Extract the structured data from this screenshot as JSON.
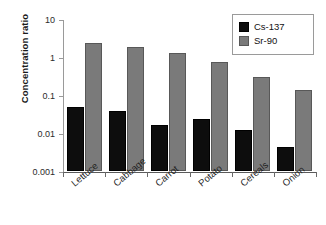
{
  "chart_data": {
    "type": "bar",
    "title": "",
    "xlabel": "",
    "ylabel": "Concentration ratio",
    "yscale": "log",
    "ylim": [
      0.001,
      10
    ],
    "ytick_labels": [
      "10",
      "1",
      "0.1",
      "0.01",
      "0.001"
    ],
    "ytick_values": [
      10,
      1,
      0.1,
      0.01,
      0.001
    ],
    "grid": false,
    "legend_position": "top-right",
    "categories": [
      "Lettuce",
      "Cabbage",
      "Carrot",
      "Potato",
      "Cereals",
      "Onion"
    ],
    "series": [
      {
        "name": "Cs-137",
        "color": "#0d0d0d",
        "values": [
          0.048,
          0.038,
          0.016,
          0.023,
          0.012,
          0.0043
        ]
      },
      {
        "name": "Sr-90",
        "color": "#7a7a7a",
        "values": [
          2.4,
          1.8,
          1.25,
          0.72,
          0.29,
          0.135
        ]
      }
    ]
  },
  "legend": {
    "items": [
      {
        "label": "Cs-137",
        "swatch": "black-square-icon"
      },
      {
        "label": "Sr-90",
        "swatch": "gray-square-icon"
      }
    ]
  }
}
